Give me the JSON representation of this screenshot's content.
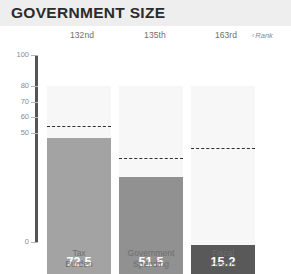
{
  "header": {
    "title": "GOVERNMENT SIZE"
  },
  "annotations": {
    "rank_caret": "‹",
    "rank_label": "Rank"
  },
  "chart_data": {
    "type": "bar",
    "title": "GOVERNMENT SIZE",
    "xlabel": "",
    "ylabel": "",
    "ylim": [
      0,
      100
    ],
    "grid": false,
    "legend": "none",
    "y_ticks": [
      {
        "label": "100",
        "value": 100
      },
      {
        "label": "80",
        "value": 80
      },
      {
        "label": "70",
        "value": 70
      },
      {
        "label": "60",
        "value": 60
      },
      {
        "label": "50",
        "value": 50
      },
      {
        "label": "0",
        "value": 0
      }
    ],
    "categories": [
      "Tax\nBurden",
      "Government\nSpending",
      "Fiscal\nHealth"
    ],
    "values": [
      72.5,
      51.5,
      15.2
    ],
    "value_labels": [
      "72.5",
      "51.5",
      "15.2"
    ],
    "ranks": [
      "132nd",
      "135th",
      "163rd"
    ],
    "bar_colors": [
      "#a3a3a3",
      "#919191",
      "#595959"
    ],
    "reference_lines": {
      "name": "world average",
      "values": [
        78.0,
        61.0,
        66.5
      ],
      "style": "dashed",
      "color": "#2e2e2e"
    }
  }
}
